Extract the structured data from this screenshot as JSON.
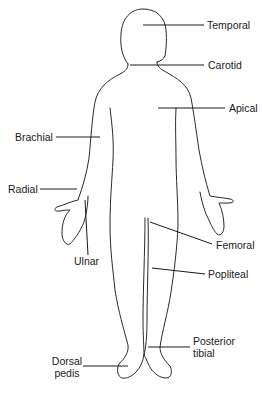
{
  "diagram": {
    "type": "anatomical-pulse-points",
    "labels": {
      "temporal": "Temporal",
      "carotid": "Carotid",
      "apical": "Apical",
      "brachial": "Brachial",
      "radial": "Radial",
      "ulnar": "Ulnar",
      "femoral": "Femoral",
      "popliteal": "Popliteal",
      "posterior_tibial_line1": "Posterior",
      "posterior_tibial_line2": "tibial",
      "dorsal_pedis_line1": "Dorsal",
      "dorsal_pedis_line2": "pedis"
    },
    "colors": {
      "line": "#2a2a2a",
      "text": "#1a1a1a",
      "background": "#ffffff"
    }
  }
}
